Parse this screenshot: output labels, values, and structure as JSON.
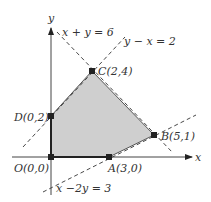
{
  "figure": {
    "axes": {
      "x_label": "x",
      "y_label": "y"
    },
    "lines": [
      {
        "id": "l1",
        "equation": "x + y = 6"
      },
      {
        "id": "l2",
        "equation": "y − x = 2"
      },
      {
        "id": "l3",
        "equation": "x −2y = 3"
      }
    ],
    "vertices": [
      {
        "id": "O",
        "label": "O(0,0)",
        "x": 0,
        "y": 0
      },
      {
        "id": "A",
        "label": "A(3,0)",
        "x": 3,
        "y": 0
      },
      {
        "id": "B",
        "label": "B(5,1)",
        "x": 5,
        "y": 1
      },
      {
        "id": "C",
        "label": "C(2,4)",
        "x": 2,
        "y": 4
      },
      {
        "id": "D",
        "label": "D(0,2)",
        "x": 0,
        "y": 2
      }
    ],
    "colors": {
      "region_fill": "#cfcfcf",
      "line": "#333333",
      "point": "#222222"
    }
  }
}
